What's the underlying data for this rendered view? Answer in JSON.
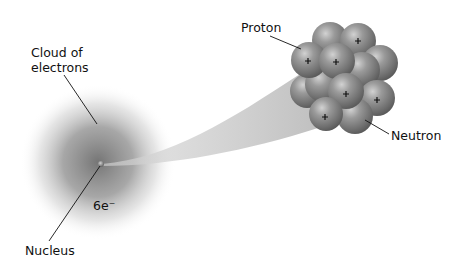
{
  "diagram": {
    "labels": {
      "cloud_line1": "Cloud of",
      "cloud_line2": "electrons",
      "proton": "Proton",
      "neutron": "Neutron",
      "electrons_count": "6e⁻",
      "nucleus": "Nucleus"
    },
    "particles": [
      {
        "type": "neutron",
        "cx": 331,
        "cy": 38
      },
      {
        "type": "proton",
        "cx": 358,
        "cy": 40,
        "sign": "+"
      },
      {
        "type": "neutron",
        "cx": 379,
        "cy": 62
      },
      {
        "type": "proton",
        "cx": 308,
        "cy": 60,
        "sign": "+"
      },
      {
        "type": "proton",
        "cx": 337,
        "cy": 61,
        "sign": "+"
      },
      {
        "type": "neutron",
        "cx": 362,
        "cy": 68
      },
      {
        "type": "neutron",
        "cx": 310,
        "cy": 90
      },
      {
        "type": "neutron",
        "cx": 322,
        "cy": 84
      },
      {
        "type": "proton",
        "cx": 346,
        "cy": 92,
        "sign": "+"
      },
      {
        "type": "proton",
        "cx": 377,
        "cy": 99,
        "sign": "+"
      },
      {
        "type": "proton",
        "cx": 325,
        "cy": 114,
        "sign": "+"
      },
      {
        "type": "neutron",
        "cx": 355,
        "cy": 117
      }
    ],
    "colors": {
      "sphere": "#8a8a8a",
      "cloud": "#6e6e6e",
      "beam": "#c8c8c8",
      "text": "#111111"
    }
  }
}
